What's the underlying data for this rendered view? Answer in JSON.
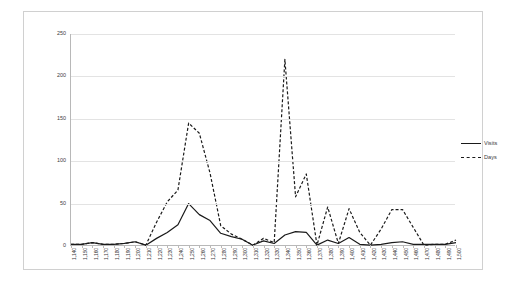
{
  "chart_data": {
    "type": "line",
    "title": "",
    "xlabel": "",
    "ylabel": "",
    "ylim": [
      0,
      250
    ],
    "y_ticks": [
      "0",
      "50",
      "100",
      "150",
      "200",
      "250"
    ],
    "grid": true,
    "legend_position": "right",
    "categories": [
      "1,140",
      "1,150",
      "1,160",
      "1,170",
      "1,180",
      "1,190",
      "1,200",
      "1,210",
      "1,220",
      "1,230",
      "1,240",
      "1,250",
      "1,260",
      "1,270",
      "1,280",
      "1,290",
      "1,300",
      "1,310",
      "1,320",
      "1,330",
      "1,340",
      "1,350",
      "1,360",
      "1,370",
      "1,380",
      "1,390",
      "1,400",
      "1,410",
      "1,420",
      "1,430",
      "1,440",
      "1,450",
      "1,460",
      "1,470",
      "1,480",
      "1,490",
      "1,500"
    ],
    "series": [
      {
        "name": "Visits",
        "style": "solid",
        "color": "#1a1a1a",
        "values": [
          2,
          2,
          4,
          2,
          2,
          3,
          5,
          1,
          9,
          16,
          25,
          50,
          37,
          30,
          15,
          11,
          8,
          1,
          6,
          3,
          13,
          17,
          16,
          1,
          7,
          3,
          10,
          2,
          1,
          2,
          4,
          5,
          2,
          2,
          2,
          2,
          4
        ]
      },
      {
        "name": "Days",
        "style": "dashed",
        "color": "#1a1a1a",
        "values": [
          2,
          2,
          4,
          2,
          2,
          3,
          5,
          1,
          28,
          52,
          66,
          145,
          133,
          86,
          24,
          14,
          8,
          1,
          9,
          4,
          220,
          58,
          85,
          1,
          46,
          3,
          44,
          16,
          1,
          20,
          43,
          43,
          22,
          1,
          2,
          2,
          7
        ]
      }
    ],
    "legend": [
      "Visits",
      "Days"
    ]
  }
}
